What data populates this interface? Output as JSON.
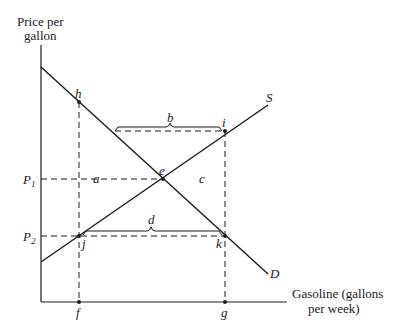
{
  "diagram": {
    "y_axis_title_line1": "Price per",
    "y_axis_title_line2": "gallon",
    "x_axis_title_line1": "Gasoline (gallons",
    "x_axis_title_line2": "per week)",
    "curves": {
      "supply_label": "S",
      "demand_label": "D"
    },
    "price_levels": {
      "p1_main": "P",
      "p1_sub": "1",
      "p2_main": "P",
      "p2_sub": "2"
    },
    "points": {
      "h": "h",
      "i": "i",
      "e": "e",
      "j": "j",
      "k": "k",
      "f": "f",
      "g": "g"
    },
    "regions": {
      "a": "a",
      "b": "b",
      "c": "c",
      "d": "d"
    },
    "colors": {
      "line": "#1a1a1a",
      "background": "#ffffff"
    }
  }
}
